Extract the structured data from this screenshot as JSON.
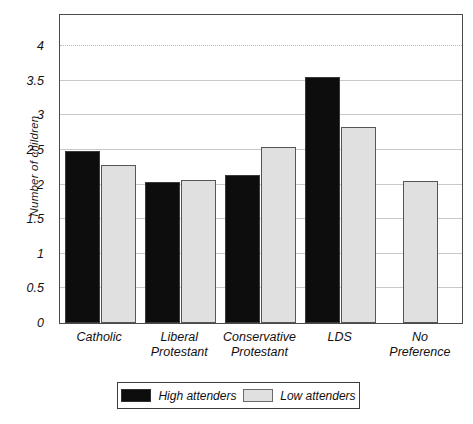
{
  "chart_data": {
    "type": "bar",
    "title": "",
    "xlabel": "",
    "ylabel": "Number of children",
    "categories": [
      "Catholic",
      "Liberal Protestant",
      "Conservative Protestant",
      "LDS",
      "No Preference"
    ],
    "category_lines": [
      [
        "Catholic"
      ],
      [
        "Liberal",
        "Protestant"
      ],
      [
        "Conservative",
        "Protestant"
      ],
      [
        "LDS"
      ],
      [
        "No",
        "Preference"
      ]
    ],
    "series": [
      {
        "name": "High attenders",
        "color": "#0d0d0d",
        "values": [
          2.49,
          2.04,
          2.14,
          3.55,
          null
        ]
      },
      {
        "name": "Low attenders",
        "color": "#e0e0e0",
        "values": [
          2.28,
          2.06,
          2.55,
          2.83,
          2.05
        ]
      }
    ],
    "ylim": [
      0,
      4.45
    ],
    "yticks": [
      0,
      0.5,
      1,
      1.5,
      2,
      2.5,
      3,
      3.5,
      4
    ],
    "ytick_labels": [
      "0",
      "0.5",
      "1",
      "1.5",
      "2",
      "2.5",
      "3",
      "3.5",
      "4"
    ],
    "grid": true,
    "legend_position": "bottom",
    "legend_entries": [
      "High attenders",
      "Low attenders"
    ]
  }
}
